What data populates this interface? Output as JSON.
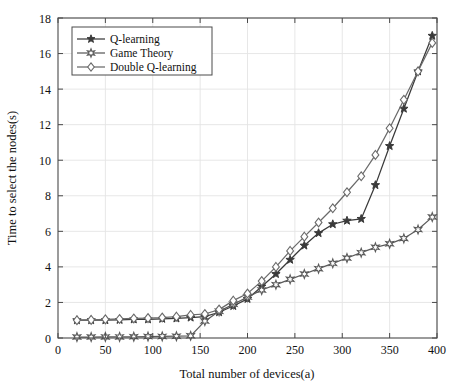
{
  "chart_data": {
    "type": "line",
    "title": "",
    "xlabel": "Total number of devices(a)",
    "ylabel": "Time to select the nodes(s)",
    "xlim": [
      0,
      400
    ],
    "ylim": [
      0,
      18
    ],
    "xticks": [
      0,
      50,
      100,
      150,
      200,
      250,
      300,
      350,
      400
    ],
    "yticks": [
      0,
      2,
      4,
      6,
      8,
      10,
      12,
      14,
      16,
      18
    ],
    "grid": true,
    "legend_position": "upper left",
    "x": [
      20,
      35,
      50,
      65,
      80,
      95,
      110,
      125,
      140,
      155,
      170,
      185,
      200,
      215,
      230,
      245,
      260,
      275,
      290,
      305,
      320,
      335,
      350,
      365,
      380,
      395
    ],
    "series": [
      {
        "name": "Q-learning",
        "marker": "star-filled",
        "color": "#3a3a3a",
        "values": [
          1.0,
          1.0,
          1.0,
          1.02,
          1.05,
          1.05,
          1.08,
          1.1,
          1.15,
          1.2,
          1.45,
          1.8,
          2.2,
          2.9,
          3.6,
          4.4,
          5.2,
          5.9,
          6.4,
          6.6,
          6.7,
          8.6,
          10.8,
          12.9,
          15.0,
          17.0
        ]
      },
      {
        "name": "Game Theory",
        "marker": "hexagram",
        "color": "#5a5a5a",
        "values": [
          0.05,
          0.05,
          0.06,
          0.06,
          0.07,
          0.08,
          0.09,
          0.1,
          0.12,
          0.95,
          1.5,
          1.9,
          2.3,
          2.7,
          3.0,
          3.3,
          3.6,
          3.9,
          4.2,
          4.5,
          4.8,
          5.1,
          5.3,
          5.6,
          6.1,
          6.8
        ]
      },
      {
        "name": "Double Q-learning",
        "marker": "diamond",
        "color": "#6a6a6a",
        "values": [
          1.0,
          1.02,
          1.05,
          1.07,
          1.1,
          1.12,
          1.15,
          1.2,
          1.3,
          1.35,
          1.6,
          2.1,
          2.5,
          3.2,
          4.0,
          4.9,
          5.7,
          6.5,
          7.3,
          8.2,
          9.1,
          10.3,
          11.8,
          13.4,
          15.0,
          16.6
        ]
      }
    ]
  },
  "legend": {
    "items": [
      {
        "label": "Q-learning"
      },
      {
        "label": "Game Theory"
      },
      {
        "label": "Double Q-learning"
      }
    ]
  },
  "colors": {
    "axis": "#4a4a4a",
    "grid": "#e4e4e4",
    "background": "#ffffff"
  }
}
